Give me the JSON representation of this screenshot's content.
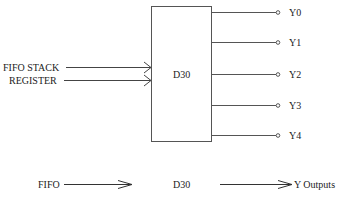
{
  "diagram": {
    "block": {
      "label": "D30"
    },
    "input": {
      "label_line1": "FIFO STACK",
      "label_line2": "REGISTER"
    },
    "outputs": [
      {
        "label": "Y0"
      },
      {
        "label": "Y1"
      },
      {
        "label": "Y2"
      },
      {
        "label": "Y3"
      },
      {
        "label": "Y4"
      }
    ],
    "flow": {
      "source": "FIFO",
      "middle": "D30",
      "target": "Y Outputs"
    },
    "colors": {
      "line": "#555555",
      "text": "#222222"
    }
  }
}
